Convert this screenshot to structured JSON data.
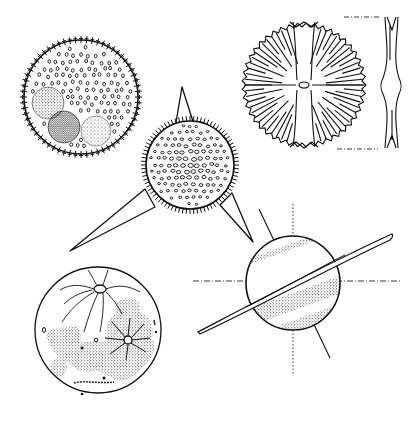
{
  "image": {
    "width": 420,
    "height": 424,
    "background": "#ffffff",
    "ink": "#111111",
    "style": "black-and-white pen-and-ink scientific illustration"
  },
  "figures": [
    {
      "id": "spiny-colony-sphere",
      "description": "Circular sphere with fringe of small spines, dotted interior and three stippled inner spheres"
    },
    {
      "id": "three-spined-radiolarian",
      "description": "Spiny dotted sphere with three long tapering spines"
    },
    {
      "id": "radial-disc",
      "description": "Disc with radiating striations, central pore and cross bands, with side profile view"
    },
    {
      "id": "moon-like-sphere",
      "description": "Sphere with rayed craters and stippled mare-like patches"
    },
    {
      "id": "ringed-planet-sphere",
      "description": "Banded stippled sphere with thin inclined ring and dashed axis lines"
    }
  ]
}
